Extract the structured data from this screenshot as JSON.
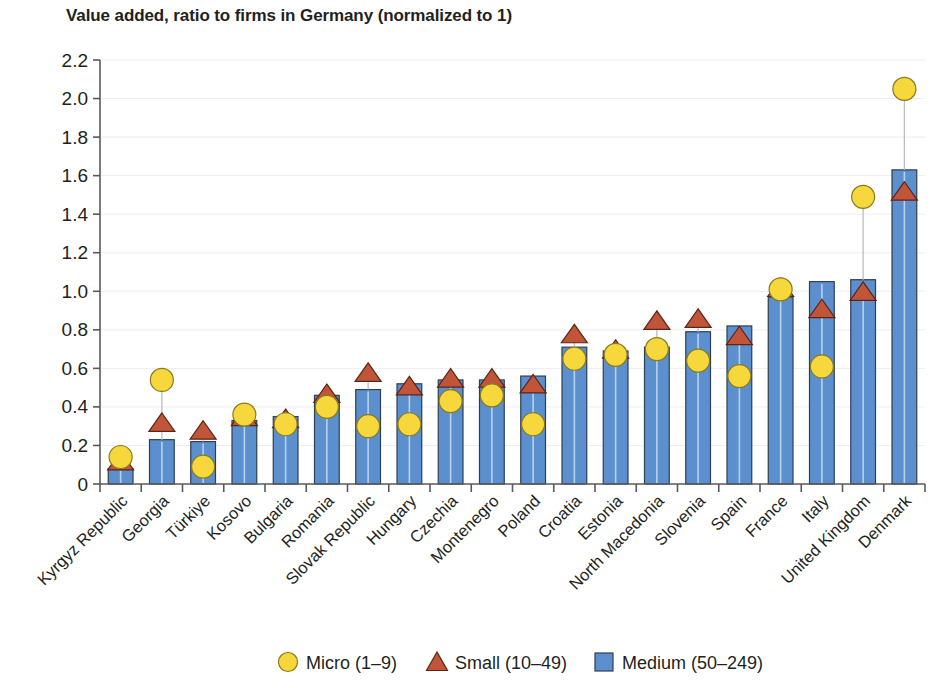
{
  "chart_data": {
    "type": "bar",
    "title": "Value added, ratio to firms in Germany (normalized to 1)",
    "xlabel": "",
    "ylabel": "",
    "ylim": [
      0,
      2.2
    ],
    "ytick_labels": [
      "0",
      "0.2",
      "0.4",
      "0.6",
      "0.8",
      "1.0",
      "1.2",
      "1.4",
      "1.6",
      "1.8",
      "2.0",
      "2.2"
    ],
    "ytick_values": [
      0,
      0.2,
      0.4,
      0.6,
      0.8,
      1.0,
      1.2,
      1.4,
      1.6,
      1.8,
      2.0,
      2.2
    ],
    "grid": true,
    "legend_position": "bottom",
    "categories": [
      "Kyrgyz Republic",
      "Georgia",
      "Türkiye",
      "Kosovo",
      "Bulgaria",
      "Romania",
      "Slovak Republic",
      "Hungary",
      "Czechia",
      "Montenegro",
      "Poland",
      "Croatia",
      "Estonia",
      "North Macedonia",
      "Slovenia",
      "Spain",
      "France",
      "Italy",
      "United Kingdom",
      "Denmark"
    ],
    "series": [
      {
        "name": "Micro (1–9)",
        "marker": "circle",
        "color": "#f6d83c",
        "values": [
          0.14,
          0.54,
          0.09,
          0.36,
          0.31,
          0.4,
          0.3,
          0.31,
          0.43,
          0.46,
          0.31,
          0.65,
          0.67,
          0.7,
          0.64,
          0.56,
          1.01,
          0.61,
          1.49,
          2.05
        ]
      },
      {
        "name": "Small (10–49)",
        "marker": "triangle",
        "color": "#c0553a",
        "values": [
          0.12,
          0.32,
          0.28,
          0.35,
          0.34,
          0.47,
          0.58,
          0.51,
          0.55,
          0.55,
          0.52,
          0.78,
          0.7,
          0.85,
          0.86,
          0.77,
          1.02,
          0.91,
          1.0,
          1.52
        ]
      },
      {
        "name": "Medium (50–249)",
        "marker": "square",
        "color": "#5b8fce",
        "values": [
          0.08,
          0.23,
          0.22,
          0.33,
          0.35,
          0.46,
          0.49,
          0.52,
          0.54,
          0.54,
          0.56,
          0.71,
          0.69,
          0.71,
          0.79,
          0.82,
          0.97,
          1.05,
          1.06,
          1.63
        ]
      }
    ]
  },
  "legend": {
    "items": [
      {
        "label": "Micro (1–9)",
        "marker": "circle",
        "color": "#f6d83c"
      },
      {
        "label": "Small (10–49)",
        "marker": "triangle",
        "color": "#c0553a"
      },
      {
        "label": "Medium (50–249)",
        "marker": "square",
        "color": "#5b8fce"
      }
    ]
  }
}
